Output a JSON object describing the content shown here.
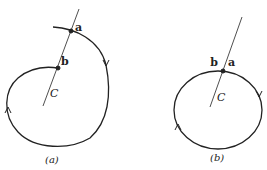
{
  "figure_a": {
    "caption": "(a)",
    "point_a": "a",
    "point_b": "b",
    "center": "C"
  },
  "figure_b": {
    "caption": "(b)",
    "point_a": "a",
    "point_b": "b",
    "center": "C"
  },
  "colors": {
    "stroke": "#222222",
    "background": "#ffffff"
  }
}
